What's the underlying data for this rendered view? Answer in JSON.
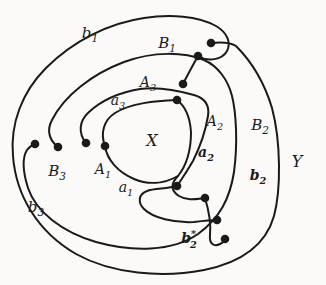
{
  "figure": {
    "canvas": {
      "width": 326,
      "height": 285,
      "background": "#fbfaf8",
      "ink": "#1a1a1a",
      "stroke_width": 2,
      "dot_radius": 4.3
    },
    "labels": [
      {
        "id": "b1",
        "text": "b",
        "sub": "1",
        "sup": "",
        "x": 90,
        "y": 38,
        "size": 15,
        "bold": false
      },
      {
        "id": "B1",
        "text": "B",
        "sub": "1",
        "sup": "",
        "x": 167,
        "y": 48,
        "size": 15,
        "bold": false
      },
      {
        "id": "A3",
        "text": "A",
        "sub": "3",
        "sup": "",
        "x": 148,
        "y": 87,
        "size": 14,
        "bold": false
      },
      {
        "id": "a3",
        "text": "a",
        "sub": "3",
        "sup": "",
        "x": 118,
        "y": 105,
        "size": 14,
        "bold": false
      },
      {
        "id": "X",
        "text": "X",
        "sub": "",
        "sup": "",
        "x": 152,
        "y": 146,
        "size": 16,
        "bold": false
      },
      {
        "id": "A2",
        "text": "A",
        "sub": "2",
        "sup": "",
        "x": 215,
        "y": 126,
        "size": 14,
        "bold": false
      },
      {
        "id": "B2",
        "text": "B",
        "sub": "2",
        "sup": "",
        "x": 260,
        "y": 130,
        "size": 15,
        "bold": false
      },
      {
        "id": "a2",
        "text": "a",
        "sub": "2",
        "sup": "",
        "x": 206,
        "y": 157,
        "size": 14,
        "bold": true
      },
      {
        "id": "Y",
        "text": "Y",
        "sub": "",
        "sup": "",
        "x": 297,
        "y": 167,
        "size": 16,
        "bold": false
      },
      {
        "id": "B3",
        "text": "B",
        "sub": "3",
        "sup": "",
        "x": 57,
        "y": 176,
        "size": 15,
        "bold": false
      },
      {
        "id": "A1",
        "text": "A",
        "sub": "1",
        "sup": "",
        "x": 103,
        "y": 174,
        "size": 14,
        "bold": false
      },
      {
        "id": "a1",
        "text": "a",
        "sub": "1",
        "sup": "",
        "x": 126,
        "y": 192,
        "size": 14,
        "bold": false
      },
      {
        "id": "b2",
        "text": "b",
        "sub": "2",
        "sup": "",
        "x": 258,
        "y": 180,
        "size": 14,
        "bold": true
      },
      {
        "id": "b3",
        "text": "b",
        "sub": "3",
        "sup": "",
        "x": 36,
        "y": 212,
        "size": 15,
        "bold": false
      },
      {
        "id": "b2star",
        "text": "b",
        "sub": "2",
        "sup": "*",
        "x": 189,
        "y": 243,
        "size": 14,
        "bold": true
      }
    ],
    "dots": [
      {
        "id": "d1",
        "x": 211,
        "y": 43
      },
      {
        "id": "d2",
        "x": 198,
        "y": 56
      },
      {
        "id": "d3",
        "x": 183,
        "y": 84
      },
      {
        "id": "d4",
        "x": 177,
        "y": 100
      },
      {
        "id": "d5",
        "x": 35,
        "y": 144
      },
      {
        "id": "d6",
        "x": 58,
        "y": 147
      },
      {
        "id": "d7",
        "x": 86,
        "y": 143
      },
      {
        "id": "d8",
        "x": 105,
        "y": 146
      },
      {
        "id": "d9",
        "x": 177,
        "y": 186
      },
      {
        "id": "d10",
        "x": 205,
        "y": 198
      },
      {
        "id": "d11",
        "x": 217,
        "y": 220
      },
      {
        "id": "d12",
        "x": 225,
        "y": 239
      }
    ],
    "curves": [
      {
        "name": "curve-b1-envelope",
        "d": "M 198 56 C 208 62, 222 60, 227 51 C 231 43, 228 33, 216 26 C 198 16, 170 14, 144 18 C 110 23, 74 40, 46 68 C 22 92, 10 124, 13 156 C 16 196, 38 232, 76 254 C 112 274, 162 278, 204 270 C 244 262, 266 244, 274 216 C 281 190, 281 142, 272 108 C 263 78, 248 58, 236 46 C 230 42, 220 42, 211 43"
      },
      {
        "name": "curve-b3-band",
        "d": "M 58 147 C 50 141, 46 131, 52 120 C 64 96, 92 74, 124 62 C 154 51, 184 52, 204 60 C 218 66, 228 80, 232 96 C 236 112, 238 142, 234 172 C 230 198, 220 218, 198 234 C 172 252, 132 252, 96 242 C 62 232, 36 212, 28 188 C 23 172, 22 158, 27 150 C 30 146, 32 145, 35 144"
      },
      {
        "name": "curve-a-band",
        "d": "M 86 143 C 78 133, 79 121, 89 112 C 103 99, 122 92, 140 89 C 160 86, 180 91, 194 95 C 204 98, 210 104, 208 116 C 205 134, 200 147, 193 161 C 186 173, 181 180, 177 186"
      },
      {
        "name": "curve-x-blob",
        "d": "M 105 146 C 100 133, 104 120, 115 113 C 131 103, 155 101, 177 100 C 185 106, 190 117, 191 132 C 191 150, 186 166, 178 176 C 170 184, 171 191, 179 196 C 187 201, 196 199, 205 198"
      },
      {
        "name": "curve-x-blob-bottom",
        "d": "M 105 146 C 107 160, 118 172, 134 179 C 148 185, 164 184, 178 176"
      },
      {
        "name": "curve-a1-arc",
        "d": "M 177 186 C 166 189, 154 188, 147 191 C 139 194, 137 202, 144 209 C 153 218, 174 223, 194 222 C 202 221, 210 220, 217 220"
      },
      {
        "name": "curve-b2-star-arc",
        "d": "M 205 198 C 209 211, 211 224, 210 235 C 209 244, 214 247, 220 244 C 224 242, 225 241, 225 239"
      },
      {
        "name": "curve-b1-inner-tail",
        "d": "M 198 56 C 193 65, 188 74, 183 84"
      }
    ]
  }
}
